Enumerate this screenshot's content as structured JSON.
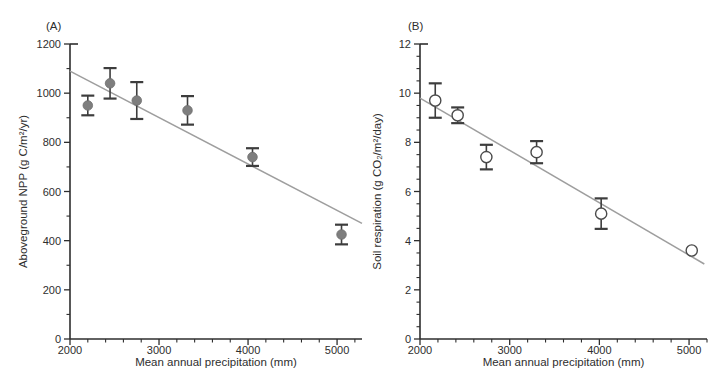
{
  "page": {
    "background": "#ffffff",
    "text_color": "#2e2e2e"
  },
  "chart_data": [
    {
      "type": "scatter",
      "panel_label": "(A)",
      "title": "",
      "xlabel": "Mean annual precipitation (mm)",
      "ylabel": "Aboveground NPP (g C/m²/yr)",
      "xlim": [
        2000,
        5280
      ],
      "ylim": [
        0,
        1200
      ],
      "x_major_ticks": [
        2000,
        3000,
        4000,
        5000
      ],
      "x_minor_step": 200,
      "y_major_ticks": [
        0,
        200,
        400,
        600,
        800,
        1000,
        1200
      ],
      "y_minor_step": 100,
      "grid": false,
      "legend": null,
      "marker": "filled",
      "marker_color": "#7e7e7e",
      "marker_stroke": "#6f6f6f",
      "error_color": "#3d3d3d",
      "trend_color": "#9e9e9e",
      "points": [
        {
          "x": 2200,
          "y": 950,
          "err": 40
        },
        {
          "x": 2450,
          "y": 1040,
          "err": 62
        },
        {
          "x": 2750,
          "y": 970,
          "err": 75
        },
        {
          "x": 3320,
          "y": 930,
          "err": 58
        },
        {
          "x": 4050,
          "y": 740,
          "err": 36
        },
        {
          "x": 5050,
          "y": 425,
          "err": 40
        }
      ],
      "trend_line": {
        "x1": 2000,
        "y1": 1090,
        "x2": 5280,
        "y2": 470
      }
    },
    {
      "type": "scatter",
      "panel_label": "(B)",
      "title": "",
      "xlabel": "Mean annual precipitation (mm)",
      "ylabel": "Soil respiration (g CO₂/m²/day)",
      "xlim": [
        2000,
        5200
      ],
      "ylim": [
        0,
        12
      ],
      "x_major_ticks": [
        2000,
        3000,
        4000,
        5000
      ],
      "x_minor_step": 200,
      "y_major_ticks": [
        0,
        2,
        4,
        6,
        8,
        10,
        12
      ],
      "y_minor_step": 0.5,
      "grid": false,
      "legend": null,
      "marker": "open",
      "marker_color": "#ffffff",
      "marker_stroke": "#4a4a4a",
      "error_color": "#3d3d3d",
      "trend_color": "#9e9e9e",
      "points": [
        {
          "x": 2170,
          "y": 9.7,
          "err": 0.7
        },
        {
          "x": 2420,
          "y": 9.1,
          "err": 0.32
        },
        {
          "x": 2740,
          "y": 7.4,
          "err": 0.5
        },
        {
          "x": 3300,
          "y": 7.6,
          "err": 0.45
        },
        {
          "x": 4020,
          "y": 5.1,
          "err": 0.62
        },
        {
          "x": 5030,
          "y": 3.6,
          "err": 0
        }
      ],
      "trend_line": {
        "x1": 2000,
        "y1": 9.8,
        "x2": 5170,
        "y2": 3.05
      }
    }
  ]
}
